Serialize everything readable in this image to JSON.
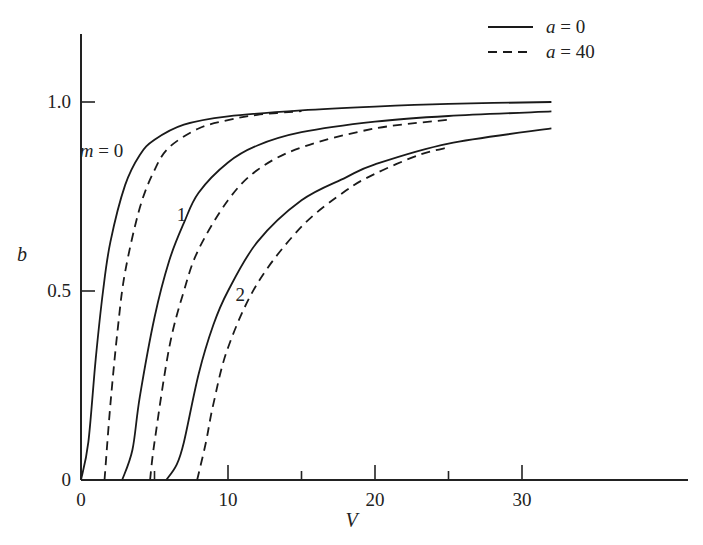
{
  "chart_data": {
    "type": "line",
    "title": "",
    "xlabel": "V",
    "ylabel": "b",
    "xlim": [
      0,
      32
    ],
    "ylim": [
      0,
      1.2
    ],
    "grid": false,
    "legend_position": "top-right",
    "x_ticks": [
      0,
      5,
      10,
      15,
      20,
      25,
      30
    ],
    "x_tick_labels": [
      "0",
      "10",
      "20",
      "30"
    ],
    "y_ticks": [
      0,
      0.5,
      1.0
    ],
    "y_tick_labels": [
      "0",
      "0.5",
      "1.0"
    ],
    "legend": [
      {
        "label_var": "a",
        "label_eq": "= 0",
        "style": "solid"
      },
      {
        "label_var": "a",
        "label_eq": "= 40",
        "style": "dashed"
      }
    ],
    "annotations": [
      {
        "text_var": "m",
        "text_eq": "= 0",
        "V": 4.0,
        "b": 0.87
      },
      {
        "text": "1",
        "V": 10.6,
        "b": 0.7
      },
      {
        "text": "2",
        "V": 14.6,
        "b": 0.49
      }
    ],
    "series": [
      {
        "name": "m=0, a=0",
        "style": "solid",
        "points": [
          [
            0,
            0
          ],
          [
            0.5,
            0.1
          ],
          [
            1,
            0.32
          ],
          [
            1.5,
            0.5
          ],
          [
            2,
            0.63
          ],
          [
            3,
            0.78
          ],
          [
            4,
            0.86
          ],
          [
            5,
            0.9
          ],
          [
            7,
            0.94
          ],
          [
            10,
            0.962
          ],
          [
            15,
            0.978
          ],
          [
            20,
            0.988
          ],
          [
            25,
            0.995
          ],
          [
            32,
            1.0
          ]
        ]
      },
      {
        "name": "m=0, a=40",
        "style": "dashed",
        "points": [
          [
            1.6,
            0
          ],
          [
            2,
            0.2
          ],
          [
            2.5,
            0.4
          ],
          [
            3,
            0.55
          ],
          [
            4,
            0.72
          ],
          [
            5,
            0.82
          ],
          [
            6,
            0.88
          ],
          [
            8,
            0.93
          ],
          [
            10,
            0.952
          ],
          [
            12,
            0.966
          ],
          [
            15,
            0.976
          ]
        ]
      },
      {
        "name": "m=1, a=0",
        "style": "solid",
        "points": [
          [
            2.8,
            0
          ],
          [
            3.5,
            0.08
          ],
          [
            4,
            0.22
          ],
          [
            5,
            0.43
          ],
          [
            6,
            0.58
          ],
          [
            7,
            0.68
          ],
          [
            8,
            0.76
          ],
          [
            10,
            0.84
          ],
          [
            12,
            0.885
          ],
          [
            15,
            0.92
          ],
          [
            20,
            0.948
          ],
          [
            25,
            0.963
          ],
          [
            32,
            0.975
          ]
        ]
      },
      {
        "name": "m=1, a=40",
        "style": "dashed",
        "points": [
          [
            4.7,
            0
          ],
          [
            5,
            0.1
          ],
          [
            6,
            0.35
          ],
          [
            7,
            0.5
          ],
          [
            8,
            0.61
          ],
          [
            10,
            0.74
          ],
          [
            12,
            0.82
          ],
          [
            15,
            0.88
          ],
          [
            20,
            0.93
          ],
          [
            25,
            0.953
          ]
        ]
      },
      {
        "name": "m=2, a=0",
        "style": "solid",
        "points": [
          [
            5.8,
            0
          ],
          [
            6.5,
            0.04
          ],
          [
            7,
            0.1
          ],
          [
            8,
            0.28
          ],
          [
            9,
            0.41
          ],
          [
            10,
            0.5
          ],
          [
            12,
            0.63
          ],
          [
            15,
            0.74
          ],
          [
            18,
            0.8
          ],
          [
            20,
            0.835
          ],
          [
            25,
            0.89
          ],
          [
            32,
            0.93
          ]
        ]
      },
      {
        "name": "m=2, a=40",
        "style": "dashed",
        "points": [
          [
            7.9,
            0
          ],
          [
            8.5,
            0.1
          ],
          [
            9,
            0.2
          ],
          [
            10,
            0.35
          ],
          [
            12,
            0.52
          ],
          [
            15,
            0.67
          ],
          [
            18,
            0.765
          ],
          [
            20,
            0.81
          ],
          [
            23,
            0.86
          ],
          [
            25,
            0.88
          ]
        ]
      }
    ]
  },
  "layout": {
    "origin_px": [
      81,
      480
    ],
    "px_per_V": 14.7,
    "px_per_b": 378,
    "x_axis_end_px": 688,
    "y_axis_top_px": 34
  }
}
